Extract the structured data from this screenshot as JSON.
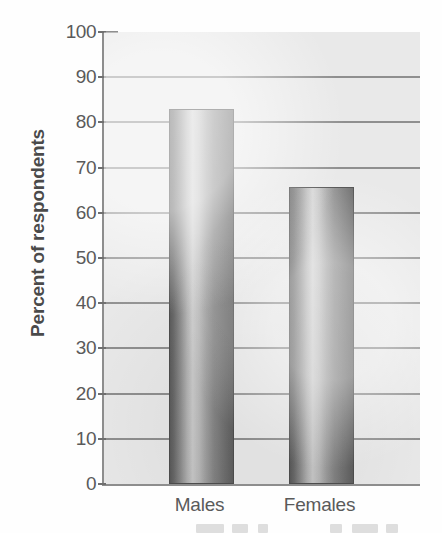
{
  "chart_data": {
    "type": "bar",
    "title": "",
    "subtitle": "",
    "xlabel": "",
    "ylabel": "Percent of respondents",
    "categories": [
      "Males",
      "Females"
    ],
    "values": [
      83,
      65.7
    ],
    "series": [
      {
        "name": "Percent of respondents",
        "values": [
          83,
          65.7
        ]
      }
    ],
    "ylim": [
      0,
      100
    ],
    "ytick_labels": [
      "0",
      "10",
      "20",
      "30",
      "40",
      "50",
      "60",
      "70",
      "80",
      "90",
      "100"
    ],
    "ytick_values": [
      0,
      10,
      20,
      30,
      40,
      50,
      60,
      70,
      80,
      90,
      100
    ],
    "grid": "horizontal",
    "legend": "none",
    "annotations": [],
    "bar_style": "vertical-gradient-cylinder",
    "colors": {
      "plot_background": "#e9e9e9",
      "axis": "#8d8d8d",
      "gridline": "#8f8f8f",
      "tick_text": "#5a5a5a",
      "axis_title": "#4a4a4a",
      "bar_dark": "#5f5f5f",
      "bar_light": "#d2d2d2",
      "bar_outline": "#4e4e4e",
      "page_background": "#fefefe"
    }
  },
  "axis": {
    "y_title": "Percent of respondents"
  }
}
